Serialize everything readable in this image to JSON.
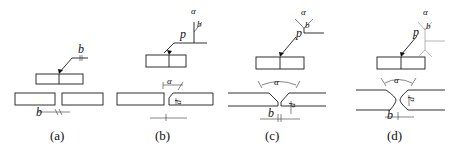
{
  "figure": {
    "panels": [
      {
        "id": "a",
        "caption": "(a)",
        "symbols": {
          "gap": "b",
          "gap_dim": "b"
        }
      },
      {
        "id": "b",
        "caption": "(b)",
        "symbols": {
          "angle": "α",
          "gap": "b",
          "root": "p",
          "dim_angle": "α",
          "dim_root": "p"
        }
      },
      {
        "id": "c",
        "caption": "(c)",
        "symbols": {
          "angle": "α",
          "gap": "b",
          "root": "p",
          "dim_angle": "α",
          "dim_root": "p",
          "dim_gap": "b"
        }
      },
      {
        "id": "d",
        "caption": "(d)",
        "symbols": {
          "angle": "α",
          "gap": "b",
          "root": "p",
          "dim_angle": "α",
          "dim_root": "p",
          "dim_gap": "b"
        }
      }
    ]
  }
}
